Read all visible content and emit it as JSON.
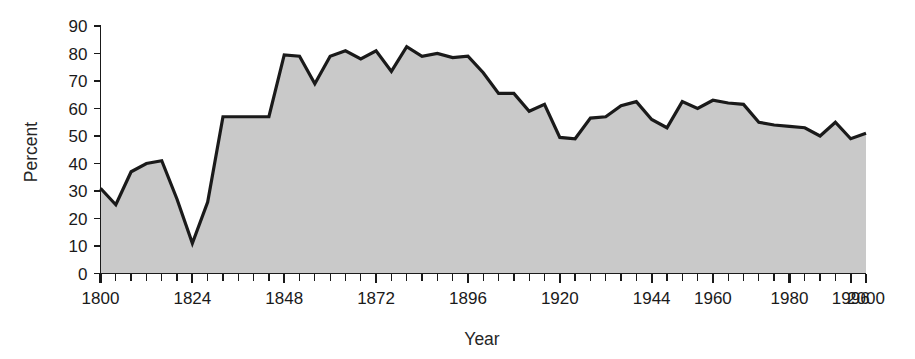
{
  "chart_data": {
    "type": "area",
    "title": "",
    "subtitle": "",
    "xlabel": "Year",
    "ylabel": "Percent",
    "xlim": [
      1800,
      2000
    ],
    "ylim": [
      0,
      90
    ],
    "grid": false,
    "legend": null,
    "x_tick_step": 4,
    "x_major_labels": [
      "1800",
      "1824",
      "1848",
      "1872",
      "1896",
      "1920",
      "1944",
      "1960",
      "1980",
      "1996",
      "2000"
    ],
    "x_major_values": [
      1800,
      1824,
      1848,
      1872,
      1896,
      1920,
      1944,
      1960,
      1980,
      1996,
      2000
    ],
    "y_tick_labels": [
      "0",
      "10",
      "20",
      "30",
      "40",
      "50",
      "60",
      "70",
      "80",
      "90"
    ],
    "y_tick_values": [
      0,
      10,
      20,
      30,
      40,
      50,
      60,
      70,
      80,
      90
    ],
    "colors": {
      "area_fill": "#c9c9c9",
      "line": "#1a1a1a",
      "axis": "#1a1a1a",
      "background": "#ffffff",
      "text": "#1a1a1a"
    },
    "x": [
      1800,
      1804,
      1808,
      1812,
      1816,
      1820,
      1824,
      1828,
      1832,
      1836,
      1840,
      1844,
      1848,
      1852,
      1856,
      1860,
      1864,
      1868,
      1872,
      1876,
      1880,
      1884,
      1888,
      1892,
      1896,
      1900,
      1904,
      1908,
      1912,
      1916,
      1920,
      1924,
      1928,
      1932,
      1936,
      1940,
      1944,
      1948,
      1952,
      1956,
      1960,
      1964,
      1968,
      1972,
      1976,
      1980,
      1984,
      1988,
      1992,
      1996,
      2000
    ],
    "values": [
      31,
      25,
      37,
      40,
      41,
      27,
      11,
      26,
      57,
      57,
      57,
      57,
      79.5,
      79,
      69,
      79,
      81,
      78,
      81,
      73.5,
      82.5,
      79,
      80,
      78.5,
      79,
      73,
      65.5,
      65.5,
      59,
      61.5,
      49.5,
      49,
      56.5,
      57,
      61,
      62.5,
      56,
      53,
      62.5,
      60,
      63,
      62,
      61.5,
      55,
      54,
      53.5,
      53,
      50,
      55,
      49,
      51
    ],
    "points_note": "Area chart, 4-year intervals, 51 points"
  },
  "figure": {
    "ylabel": "Percent",
    "xlabel": "Year"
  }
}
